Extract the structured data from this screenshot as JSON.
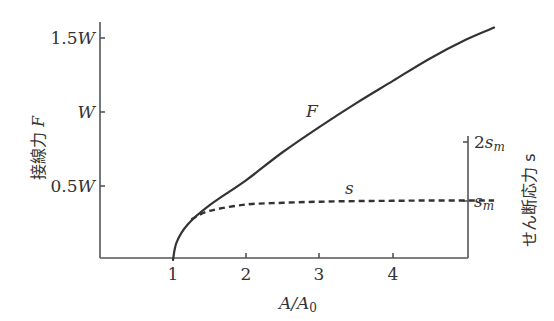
{
  "chart_data": {
    "type": "line",
    "title": "",
    "xlabel": "A/A0",
    "ylabel_left": "接線力 F",
    "ylabel_right": "せん断応力 s",
    "x_ticks": [
      "1",
      "2",
      "3",
      "4"
    ],
    "x_tick_values": [
      1,
      2,
      3,
      4
    ],
    "xlim": [
      0,
      5.4
    ],
    "y_left_ticks": [
      "0.5W",
      "W",
      "1.5W"
    ],
    "y_left_tick_values": [
      0.5,
      1.0,
      1.5
    ],
    "y_left_unit": "W",
    "y_right_ticks": [
      "s_m",
      "2s_m"
    ],
    "y_right_tick_values": [
      1,
      2
    ],
    "y_right_unit": "s_m",
    "grid": false,
    "legend": "inline labels",
    "series": [
      {
        "name": "F",
        "style": "solid",
        "axis": "left",
        "x": [
          1.0,
          1.05,
          1.2,
          1.5,
          2.0,
          2.5,
          3.0,
          3.5,
          4.0,
          4.5,
          5.0,
          5.38
        ],
        "y": [
          0.0,
          0.12,
          0.24,
          0.37,
          0.54,
          0.73,
          0.9,
          1.06,
          1.21,
          1.36,
          1.49,
          1.57
        ]
      },
      {
        "name": "s",
        "style": "dashed",
        "axis": "right",
        "x": [
          1.25,
          1.5,
          2.0,
          2.5,
          3.0,
          3.5,
          4.0,
          4.5,
          5.0,
          5.38
        ],
        "y": [
          0.67,
          0.82,
          0.93,
          0.96,
          0.98,
          0.99,
          0.995,
          1.0,
          1.0,
          1.0
        ]
      }
    ]
  },
  "labels": {
    "x_axis": "A/A",
    "x_axis_sub": "0",
    "y_left_1": "1.5",
    "y_left_2": "",
    "y_left_3": "0.5",
    "y_unit": "W",
    "y_right_2sm_coef": "2",
    "y_right_s": "s",
    "y_right_sub": "m",
    "left_title_jp": "接線力",
    "left_title_var": "F",
    "right_title_jp": "せん断応力",
    "right_title_var": "s",
    "curve_F": "F",
    "curve_s": "s",
    "x1": "1",
    "x2": "2",
    "x3": "3",
    "x4": "4"
  },
  "colors": {
    "ink": "#333333",
    "axis": "#555555",
    "background": "#ffffff"
  }
}
